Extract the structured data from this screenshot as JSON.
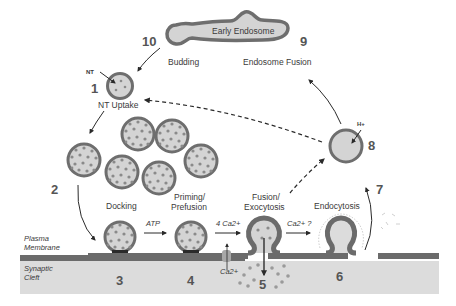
{
  "diagram": {
    "colors": {
      "vesicle_fill": "#d4d4d4",
      "vesicle_border": "#6e6e6e",
      "dot": "#8a8a8a",
      "membrane": "#6b6b6b",
      "cleft": "#dcdcdc",
      "text": "#3a3a3a",
      "number": "#555555"
    },
    "steps": [
      {
        "number": "1",
        "label": "NT Uptake"
      },
      {
        "number": "2",
        "label": ""
      },
      {
        "number": "3",
        "label": "Docking"
      },
      {
        "number": "4",
        "label": "Priming/ Prefusion"
      },
      {
        "number": "5",
        "label": "Fusion/ Exocytosis"
      },
      {
        "number": "6",
        "label": ""
      },
      {
        "number": "7",
        "label": "Endocytosis"
      },
      {
        "number": "8",
        "label": ""
      },
      {
        "number": "9",
        "label": "Endosome Fusion"
      },
      {
        "number": "10",
        "label": "Budding"
      }
    ],
    "labels": {
      "early_endosome": "Early Endosome",
      "budding": "Budding",
      "endosome_fusion": "Endosome Fusion",
      "nt": "NT",
      "nt_uptake": "NT Uptake",
      "docking": "Docking",
      "priming_line1": "Priming/",
      "priming_line2": "Prefusion",
      "fusion_line1": "Fusion/",
      "fusion_line2": "Exocytosis",
      "endocytosis": "Endocytosis",
      "h_plus": "H+",
      "atp": "ATP",
      "four_ca": "4 Ca2+",
      "ca_question": "Ca2+ ?",
      "ca_channel": "Ca2+",
      "plasma_line1": "Plasma",
      "plasma_line2": "Membrane",
      "synaptic_line1": "Synaptic",
      "synaptic_line2": "Cleft"
    },
    "numbers": {
      "n1": "1",
      "n2": "2",
      "n3": "3",
      "n4": "4",
      "n5": "5",
      "n6": "6",
      "n7": "7",
      "n8": "8",
      "n9": "9",
      "n10": "10"
    }
  }
}
